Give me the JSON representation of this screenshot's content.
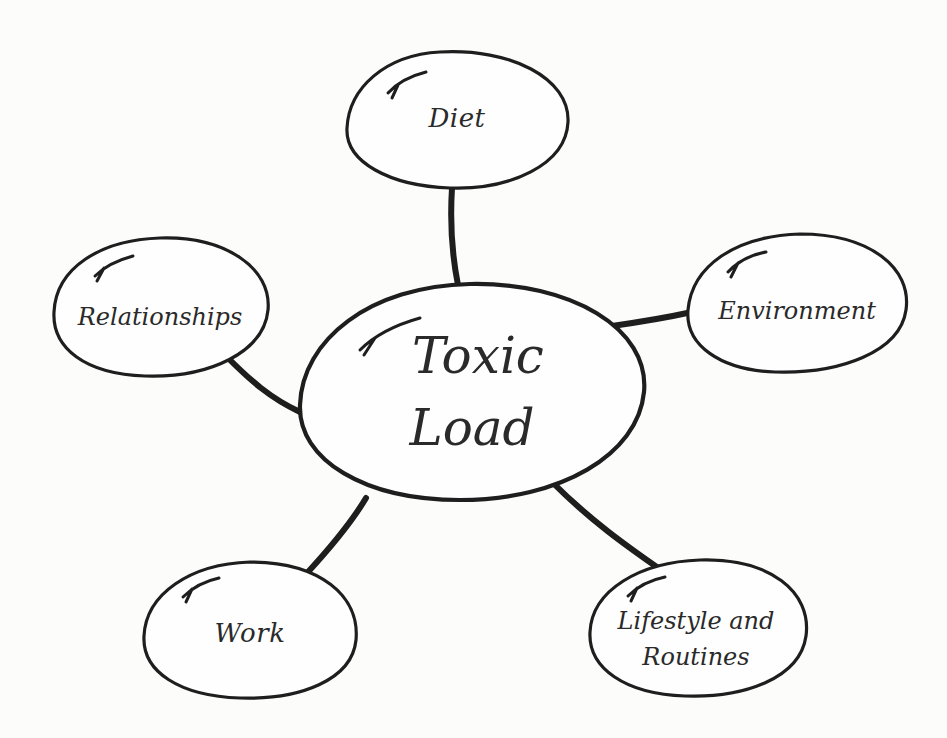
{
  "diagram": {
    "type": "mind-map",
    "center": {
      "line1": "Toxic",
      "line2": "Load"
    },
    "nodes": [
      {
        "id": "diet",
        "label": "Diet"
      },
      {
        "id": "relationships",
        "label": "Relationships"
      },
      {
        "id": "environment",
        "label": "Environment"
      },
      {
        "id": "work",
        "label": "Work"
      },
      {
        "id": "lifestyle",
        "line1": "Lifestyle and",
        "line2": "Routines"
      }
    ],
    "colors": {
      "stroke": "#1e1e1e",
      "text": "#2a2a2a",
      "background": "#fcfcfb"
    }
  }
}
